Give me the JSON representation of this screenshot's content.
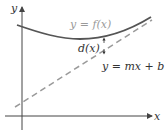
{
  "diagram": {
    "axes": {
      "x_label": "x",
      "y_label": "y"
    },
    "curve": {
      "label": "y = f(x)",
      "color": "#555555",
      "label_color": "#9a9a9a"
    },
    "line": {
      "label": "y = mx + b",
      "style": "dashed",
      "color": "#999999"
    },
    "distance": {
      "label": "d(x)"
    }
  }
}
